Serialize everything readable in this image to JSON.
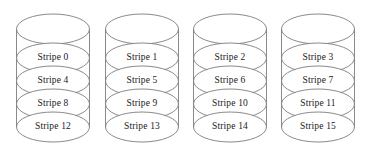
{
  "diagram": {
    "background_color": "#ffffff",
    "stroke_color": "#7d7d7d",
    "text_color": "#1a1a1a",
    "stripe_label_prefix": "Stripe",
    "disks": [
      {
        "name": "disk-0",
        "x": 15,
        "stripes": [
          {
            "label": "Stripe 0"
          },
          {
            "label": "Stripe 4"
          },
          {
            "label": "Stripe 8"
          },
          {
            "label": "Stripe 12"
          }
        ]
      },
      {
        "name": "disk-1",
        "x": 104,
        "stripes": [
          {
            "label": "Stripe 1"
          },
          {
            "label": "Stripe 5"
          },
          {
            "label": "Stripe 9"
          },
          {
            "label": "Stripe 13"
          }
        ]
      },
      {
        "name": "disk-2",
        "x": 192,
        "stripes": [
          {
            "label": "Stripe 2"
          },
          {
            "label": "Stripe 6"
          },
          {
            "label": "Stripe 10"
          },
          {
            "label": "Stripe 14"
          }
        ]
      },
      {
        "name": "disk-3",
        "x": 280,
        "stripes": [
          {
            "label": "Stripe 3"
          },
          {
            "label": "Stripe 7"
          },
          {
            "label": "Stripe 11"
          },
          {
            "label": "Stripe 15"
          }
        ]
      }
    ]
  }
}
